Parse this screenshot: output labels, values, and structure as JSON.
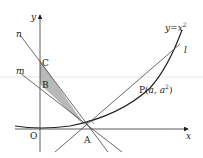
{
  "diagram": {
    "title": "",
    "curve_label": "y=x",
    "curve_exp": "2",
    "axes": {
      "x_label": "x",
      "y_label": "y",
      "origin_label": "O"
    },
    "lines": {
      "n": "n",
      "m": "m",
      "l": "l"
    },
    "points": {
      "C": "C",
      "B": "B",
      "A": "A",
      "P": "P(",
      "P_a": "a",
      "P_sep": ", ",
      "P_a2": "a",
      "P_exp": "2",
      "P_close": ")"
    },
    "colors": {
      "line": "#333333",
      "shade": "#b8b8b8"
    }
  }
}
